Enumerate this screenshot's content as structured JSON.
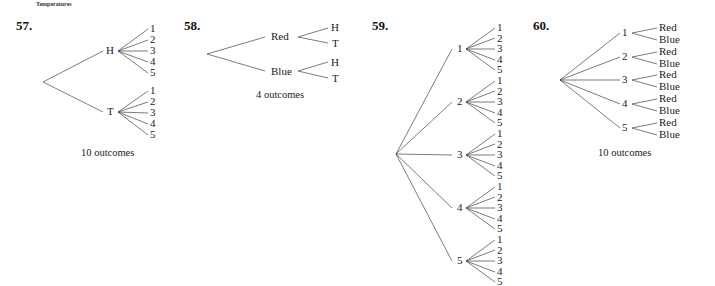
{
  "header_caption": "Temperatures",
  "problems": [
    {
      "number": "57.",
      "root": "",
      "level1": [
        "H",
        "T"
      ],
      "level2": [
        "1",
        "2",
        "3",
        "4",
        "5"
      ],
      "outcomes": "10 outcomes"
    },
    {
      "number": "58.",
      "level1": [
        "Red",
        "Blue"
      ],
      "level2": [
        "H",
        "T"
      ],
      "outcomes": "4 outcomes"
    },
    {
      "number": "59.",
      "level1": [
        "1",
        "2",
        "3",
        "4",
        "5"
      ],
      "level2": [
        "1",
        "2",
        "3",
        "4",
        "5"
      ],
      "outcomes": ""
    },
    {
      "number": "60.",
      "level1": [
        "1",
        "2",
        "3",
        "4",
        "5"
      ],
      "level2": [
        "Red",
        "Blue"
      ],
      "outcomes": "10 outcomes"
    }
  ]
}
